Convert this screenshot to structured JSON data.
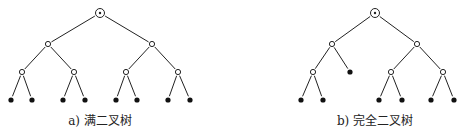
{
  "figures": [
    {
      "id": "a",
      "caption": "a) 满二叉树",
      "caption_x": 100,
      "nodes": [
        {
          "id": "r",
          "x": 100,
          "y": 13,
          "type": "root"
        },
        {
          "id": "l1a",
          "x": 48,
          "y": 44,
          "type": "internal"
        },
        {
          "id": "l1b",
          "x": 152,
          "y": 44,
          "type": "internal"
        },
        {
          "id": "l2a",
          "x": 22,
          "y": 72,
          "type": "internal"
        },
        {
          "id": "l2b",
          "x": 74,
          "y": 72,
          "type": "internal"
        },
        {
          "id": "l2c",
          "x": 126,
          "y": 72,
          "type": "internal"
        },
        {
          "id": "l2d",
          "x": 178,
          "y": 72,
          "type": "internal"
        },
        {
          "id": "f1",
          "x": 11,
          "y": 100,
          "type": "leaf"
        },
        {
          "id": "f2",
          "x": 32,
          "y": 100,
          "type": "leaf"
        },
        {
          "id": "f3",
          "x": 63,
          "y": 100,
          "type": "leaf"
        },
        {
          "id": "f4",
          "x": 85,
          "y": 100,
          "type": "leaf"
        },
        {
          "id": "f5",
          "x": 116,
          "y": 100,
          "type": "leaf"
        },
        {
          "id": "f6",
          "x": 137,
          "y": 100,
          "type": "leaf"
        },
        {
          "id": "f7",
          "x": 168,
          "y": 100,
          "type": "leaf"
        },
        {
          "id": "f8",
          "x": 190,
          "y": 100,
          "type": "leaf"
        }
      ],
      "edges": [
        [
          "r",
          "l1a"
        ],
        [
          "r",
          "l1b"
        ],
        [
          "l1a",
          "l2a"
        ],
        [
          "l1a",
          "l2b"
        ],
        [
          "l1b",
          "l2c"
        ],
        [
          "l1b",
          "l2d"
        ],
        [
          "l2a",
          "f1"
        ],
        [
          "l2a",
          "f2"
        ],
        [
          "l2b",
          "f3"
        ],
        [
          "l2b",
          "f4"
        ],
        [
          "l2c",
          "f5"
        ],
        [
          "l2c",
          "f6"
        ],
        [
          "l2d",
          "f7"
        ],
        [
          "l2d",
          "f8"
        ]
      ]
    },
    {
      "id": "b",
      "caption": "b) 完全二叉树",
      "caption_x": 375,
      "nodes": [
        {
          "id": "r",
          "x": 375,
          "y": 13,
          "type": "root"
        },
        {
          "id": "l1a",
          "x": 332,
          "y": 44,
          "type": "internal"
        },
        {
          "id": "l1b",
          "x": 417,
          "y": 44,
          "type": "internal"
        },
        {
          "id": "l2a",
          "x": 313,
          "y": 72,
          "type": "internal"
        },
        {
          "id": "l2b",
          "x": 350,
          "y": 72,
          "type": "leaf"
        },
        {
          "id": "l2c",
          "x": 391,
          "y": 72,
          "type": "internal"
        },
        {
          "id": "l2d",
          "x": 443,
          "y": 72,
          "type": "internal"
        },
        {
          "id": "f1",
          "x": 301,
          "y": 100,
          "type": "leaf"
        },
        {
          "id": "f2",
          "x": 323,
          "y": 100,
          "type": "leaf"
        },
        {
          "id": "f3",
          "x": 379,
          "y": 100,
          "type": "leaf"
        },
        {
          "id": "f4",
          "x": 402,
          "y": 100,
          "type": "leaf"
        },
        {
          "id": "f5",
          "x": 431,
          "y": 100,
          "type": "leaf"
        },
        {
          "id": "f6",
          "x": 454,
          "y": 100,
          "type": "leaf"
        }
      ],
      "edges": [
        [
          "r",
          "l1a"
        ],
        [
          "r",
          "l1b"
        ],
        [
          "l1a",
          "l2a"
        ],
        [
          "l1a",
          "l2b"
        ],
        [
          "l1b",
          "l2c"
        ],
        [
          "l1b",
          "l2d"
        ],
        [
          "l2a",
          "f1"
        ],
        [
          "l2a",
          "f2"
        ],
        [
          "l2c",
          "f3"
        ],
        [
          "l2c",
          "f4"
        ],
        [
          "l2d",
          "f5"
        ],
        [
          "l2d",
          "f6"
        ]
      ]
    }
  ]
}
